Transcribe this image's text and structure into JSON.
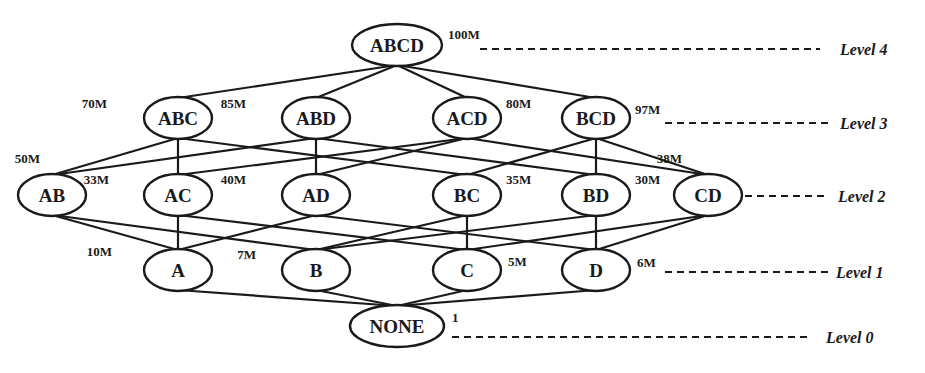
{
  "diagram": {
    "type": "cuboid-lattice",
    "nodes": [
      {
        "id": "ABCD",
        "label": "ABCD",
        "size": "100M",
        "level": 4,
        "x": 397,
        "y": 45,
        "rx": 45,
        "sx": 448,
        "sy": 43
      },
      {
        "id": "ABC",
        "label": "ABC",
        "size": "70M",
        "level": 3,
        "x": 178,
        "y": 118,
        "rx": 34,
        "sx": 107,
        "sy": 112
      },
      {
        "id": "ABD",
        "label": "ABD",
        "size": "85M",
        "level": 3,
        "x": 316,
        "y": 118,
        "rx": 34,
        "sx": 246,
        "sy": 112
      },
      {
        "id": "ACD",
        "label": "ACD",
        "size": "80M",
        "level": 3,
        "x": 467,
        "y": 118,
        "rx": 34,
        "sx": 506,
        "sy": 112
      },
      {
        "id": "BCD",
        "label": "BCD",
        "size": "97M",
        "level": 3,
        "x": 596,
        "y": 118,
        "rx": 34,
        "sx": 635,
        "sy": 118
      },
      {
        "id": "AB",
        "label": "AB",
        "size": "50M",
        "level": 2,
        "x": 52,
        "y": 195,
        "rx": 34,
        "sx": 40,
        "sy": 167
      },
      {
        "id": "AC",
        "label": "AC",
        "size": "33M",
        "level": 2,
        "x": 178,
        "y": 195,
        "rx": 34,
        "sx": 109,
        "sy": 188
      },
      {
        "id": "AD",
        "label": "AD",
        "size": "40M",
        "level": 2,
        "x": 316,
        "y": 195,
        "rx": 34,
        "sx": 246,
        "sy": 188
      },
      {
        "id": "BC",
        "label": "BC",
        "size": "35M",
        "level": 2,
        "x": 467,
        "y": 195,
        "rx": 34,
        "sx": 506,
        "sy": 188
      },
      {
        "id": "BD",
        "label": "BD",
        "size": "30M",
        "level": 2,
        "x": 596,
        "y": 195,
        "rx": 34,
        "sx": 635,
        "sy": 188
      },
      {
        "id": "CD",
        "label": "CD",
        "size": "38M",
        "level": 2,
        "x": 708,
        "y": 195,
        "rx": 34,
        "sx": 682,
        "sy": 167
      },
      {
        "id": "A",
        "label": "A",
        "size": "10M",
        "level": 1,
        "x": 178,
        "y": 270,
        "rx": 34,
        "sx": 112,
        "sy": 260
      },
      {
        "id": "B",
        "label": "B",
        "size": "7M",
        "level": 1,
        "x": 316,
        "y": 270,
        "rx": 34,
        "sx": 256,
        "sy": 263
      },
      {
        "id": "C",
        "label": "C",
        "size": "5M",
        "level": 1,
        "x": 467,
        "y": 270,
        "rx": 34,
        "sx": 508,
        "sy": 270
      },
      {
        "id": "D",
        "label": "D",
        "size": "6M",
        "level": 1,
        "x": 596,
        "y": 270,
        "rx": 34,
        "sx": 637,
        "sy": 271
      },
      {
        "id": "NONE",
        "label": "NONE",
        "size": "1",
        "level": 0,
        "x": 397,
        "y": 326,
        "rx": 47,
        "sx": 452,
        "sy": 326
      }
    ],
    "edges": [
      [
        "ABCD",
        "ABC"
      ],
      [
        "ABCD",
        "ABD"
      ],
      [
        "ABCD",
        "ACD"
      ],
      [
        "ABCD",
        "BCD"
      ],
      [
        "ABC",
        "AB"
      ],
      [
        "ABC",
        "AC"
      ],
      [
        "ABC",
        "BC"
      ],
      [
        "ABD",
        "AB"
      ],
      [
        "ABD",
        "AD"
      ],
      [
        "ABD",
        "BD"
      ],
      [
        "ACD",
        "AC"
      ],
      [
        "ACD",
        "AD"
      ],
      [
        "ACD",
        "CD"
      ],
      [
        "BCD",
        "BC"
      ],
      [
        "BCD",
        "BD"
      ],
      [
        "BCD",
        "CD"
      ],
      [
        "AB",
        "A"
      ],
      [
        "AB",
        "B"
      ],
      [
        "AC",
        "A"
      ],
      [
        "AC",
        "C"
      ],
      [
        "AD",
        "A"
      ],
      [
        "AD",
        "D"
      ],
      [
        "BC",
        "B"
      ],
      [
        "BC",
        "C"
      ],
      [
        "BD",
        "B"
      ],
      [
        "BD",
        "D"
      ],
      [
        "CD",
        "C"
      ],
      [
        "CD",
        "D"
      ],
      [
        "A",
        "NONE"
      ],
      [
        "B",
        "NONE"
      ],
      [
        "C",
        "NONE"
      ],
      [
        "D",
        "NONE"
      ]
    ],
    "levels": [
      {
        "label": "Level 4",
        "y": 49,
        "dash_from": 480,
        "dash_to": 820,
        "text_x": 840
      },
      {
        "label": "Level 3",
        "y": 123,
        "dash_from": 665,
        "dash_to": 830,
        "text_x": 840
      },
      {
        "label": "Level 2",
        "y": 196,
        "dash_from": 745,
        "dash_to": 825,
        "text_x": 838
      },
      {
        "label": "Level 1",
        "y": 272,
        "dash_from": 665,
        "dash_to": 830,
        "text_x": 836
      },
      {
        "label": "Level 0",
        "y": 337,
        "dash_from": 452,
        "dash_to": 810,
        "text_x": 826
      }
    ]
  }
}
